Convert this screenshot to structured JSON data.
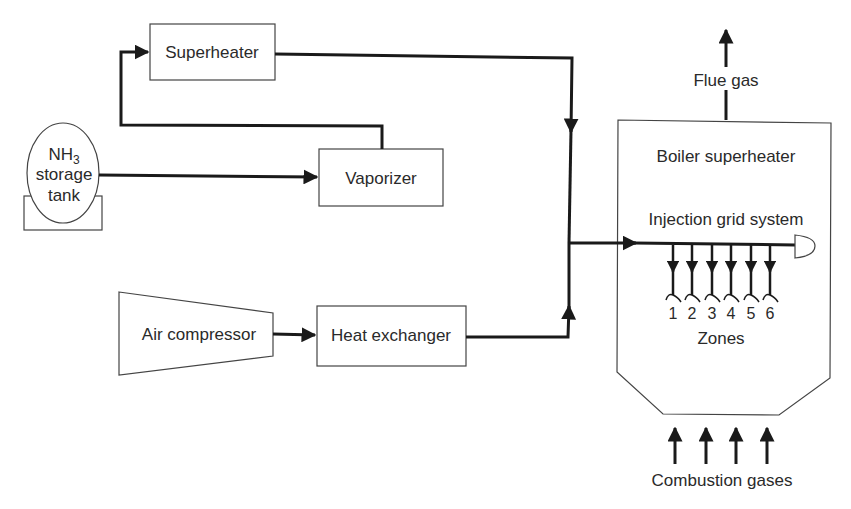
{
  "diagram": {
    "components": {
      "tank": {
        "line1": "NH",
        "subscript": "3",
        "line2": "storage",
        "line3": "tank"
      },
      "superheater": "Superheater",
      "vaporizer": "Vaporizer",
      "air_compressor": "Air compressor",
      "heat_exchanger": "Heat exchanger",
      "boiler": "Boiler superheater",
      "injection_grid": "Injection grid system",
      "zones_label": "Zones",
      "flue_gas": "Flue gas",
      "combustion_gases": "Combustion gases"
    },
    "zones": [
      "1",
      "2",
      "3",
      "4",
      "5",
      "6"
    ],
    "colors": {
      "line": "#1a1a1a",
      "box_border": "#444444",
      "background": "#ffffff"
    }
  }
}
